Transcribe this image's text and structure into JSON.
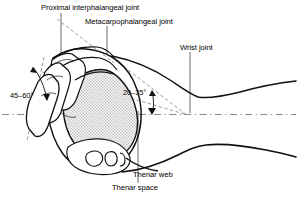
{
  "figure": {
    "type": "anatomical-line-diagram",
    "background_color": "#ffffff",
    "line_color": "#000000",
    "guide_color": "#7a7a7a",
    "shading_color": "#c8c8c8"
  },
  "labels": {
    "proximal_interphalangeal_joint": "Proximal interphalangeal joint",
    "metacarpophalangeal_joint": "Metacarpophalangeal joint",
    "wrist_joint": "Wrist joint",
    "thenar_web": "Thenar web",
    "thenar_space": "Thenar space"
  },
  "angles": {
    "thumb_angle": "45–60°",
    "wrist_angle": "20–35°"
  },
  "annotations": {
    "centerline": "longitudinal axis reference",
    "leader_lines": 5,
    "dashed_construction_lines": 4
  }
}
